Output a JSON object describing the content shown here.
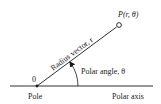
{
  "diagram": {
    "labels": {
      "origin": "0",
      "pole": "Pole",
      "polar_axis": "Polar axis",
      "polar_angle": "Polar angle, θ",
      "radius_vector": "Radius vector, r",
      "point": "P(r, θ)"
    },
    "geometry": {
      "axis_line": {
        "x1": 10,
        "y1": 86,
        "x2": 153,
        "y2": 86
      },
      "origin": {
        "x": 37,
        "y": 86
      },
      "point": {
        "x": 119,
        "y": 25
      },
      "angle_arc_radius": 41
    },
    "colors": {
      "stroke": "#1a1a1a",
      "background": "#ffffff"
    }
  }
}
